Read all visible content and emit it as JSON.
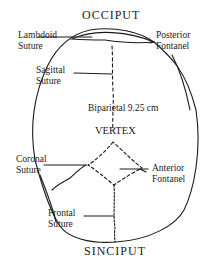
{
  "diagram": {
    "title_top": "OCCIPUT",
    "title_bottom": "SINCIPUT",
    "center_label": "VERTEX",
    "measurement": "Biparietal 9.25 cm",
    "labels": {
      "lambdoid": [
        "Lambdoid",
        "Suture"
      ],
      "posterior": [
        "Posterior",
        "Fontanel"
      ],
      "sagittal": [
        "Sagittal",
        "Suture"
      ],
      "coronal": [
        "Coronal",
        "Suture"
      ],
      "anterior": [
        "Anterior",
        "Fontanel"
      ],
      "frontal": [
        "Frontal",
        "Suture"
      ]
    },
    "colors": {
      "ink": "#1a1a1a",
      "background": "#ffffff"
    }
  }
}
